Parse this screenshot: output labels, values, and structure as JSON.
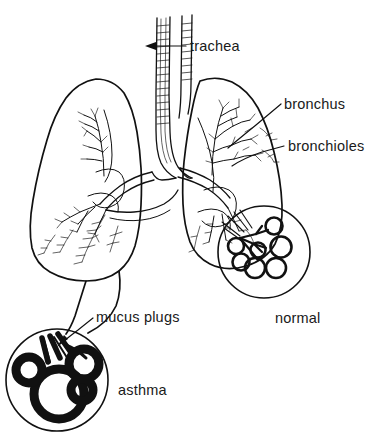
{
  "figure": {
    "background_color": "#ffffff",
    "ink_color": "#111111",
    "width": 382,
    "height": 440
  },
  "labels": {
    "trachea": "trachea",
    "bronchus": "bronchus",
    "bronchioles": "bronchioles",
    "mucus_plugs": "mucus plugs",
    "normal": "normal",
    "asthma": "asthma"
  },
  "annotations": [
    {
      "name": "trachea",
      "text": "trachea",
      "text_x": 190,
      "text_y": 50,
      "has_arrow": true,
      "arrow_direction": "left",
      "points_to": "trachea tube"
    },
    {
      "name": "bronchus",
      "text": "bronchus",
      "text_x": 284,
      "text_y": 108,
      "has_arrow": false,
      "points_to": "right lung main bronchus"
    },
    {
      "name": "bronchioles",
      "text": "bronchioles",
      "text_x": 288,
      "text_y": 150,
      "has_arrow": false,
      "points_to": "right lung small airways"
    },
    {
      "name": "mucus-plugs",
      "text": "mucus plugs",
      "text_x": 96,
      "text_y": 321,
      "has_arrow": true,
      "arrow_direction": "down-left",
      "points_to": "asthma detail airway"
    },
    {
      "name": "normal-caption",
      "text": "normal",
      "text_x": 275,
      "text_y": 322,
      "has_arrow": false,
      "points_to": "normal detail circle"
    },
    {
      "name": "asthma-caption",
      "text": "asthma",
      "text_x": 118,
      "text_y": 394,
      "has_arrow": false,
      "points_to": "asthma detail circle"
    }
  ],
  "detail_circles": [
    {
      "name": "normal-detail",
      "caption": "normal",
      "center_x": 264,
      "center_y": 252,
      "radius": 46,
      "wall_thickness": "thin",
      "alveoli_count": 7,
      "airway_state": "open"
    },
    {
      "name": "asthma-detail",
      "caption": "asthma",
      "center_x": 57,
      "center_y": 380,
      "radius": 51,
      "wall_thickness": "thick",
      "alveoli_count": 4,
      "airway_state": "narrowed by mucus plugs"
    }
  ]
}
